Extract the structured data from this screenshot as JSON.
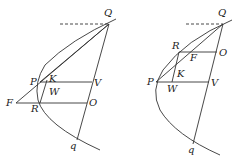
{
  "figures": [
    {
      "name": "left-figure",
      "labels": {
        "Q": "Q",
        "P": "P",
        "K": "K",
        "W": "W",
        "V": "V",
        "F": "F",
        "R": "R",
        "O": "O",
        "q": "q"
      }
    },
    {
      "name": "right-figure",
      "labels": {
        "Q": "Q",
        "R": "R",
        "F": "F",
        "O": "O",
        "K": "K",
        "P": "P",
        "W": "W",
        "V": "V",
        "q": "q"
      }
    }
  ],
  "colors": {
    "stroke": "#333333",
    "background": "#ffffff"
  }
}
